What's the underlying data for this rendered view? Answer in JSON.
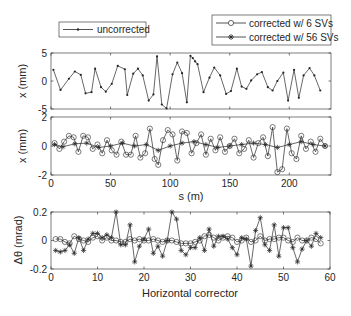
{
  "chart_data": [
    {
      "type": "line",
      "title": "",
      "xlabel": "",
      "ylabel": "x (mm)",
      "xlim": [
        0,
        235
      ],
      "ylim": [
        -5,
        5
      ],
      "yticks": [
        -5,
        0,
        5
      ],
      "xticks": [
        0,
        50,
        100,
        150,
        200
      ],
      "series": [
        {
          "name": "uncorrected",
          "marker": "dot",
          "x": [
            2,
            8,
            15,
            20,
            25,
            29,
            34,
            37,
            42,
            46,
            51,
            56,
            62,
            64,
            69,
            73,
            77,
            82,
            86,
            89,
            93,
            97,
            102,
            106,
            110,
            114,
            117,
            119,
            121,
            123,
            128,
            133,
            137,
            142,
            147,
            151,
            156,
            160,
            164,
            168,
            173,
            177,
            182,
            186,
            190,
            195,
            199,
            204,
            208,
            212,
            217,
            221,
            226
          ],
          "values": [
            2.0,
            -1.6,
            0.4,
            1.7,
            1.1,
            -2.2,
            -2.0,
            2.2,
            -1.1,
            -1.9,
            -0.5,
            2.7,
            2.1,
            -2.5,
            1.3,
            2.2,
            1.0,
            -3.5,
            -2.4,
            4.4,
            -4.2,
            -4.9,
            1.2,
            3.3,
            1.4,
            -3.8,
            4.5,
            4.1,
            3.5,
            3.0,
            -2.0,
            0.6,
            2.4,
            1.0,
            -2.3,
            -1.8,
            2.2,
            -1.0,
            -1.4,
            0.1,
            1.2,
            1.6,
            -1.1,
            -1.7,
            0.0,
            1.5,
            -3.5,
            2.0,
            -3.0,
            1.0,
            2.3,
            1.0,
            -1.7
          ]
        }
      ]
    },
    {
      "type": "line",
      "title": "",
      "xlabel": "s (m)",
      "ylabel": "x (mm)",
      "xlim": [
        0,
        235
      ],
      "ylim": [
        -2,
        2
      ],
      "yticks": [
        -2,
        0,
        2
      ],
      "xticks": [
        0,
        50,
        100,
        150,
        200
      ],
      "series": [
        {
          "name": "corrected w/ 6 SVs",
          "marker": "circle",
          "x": [
            3,
            7,
            11,
            15,
            19,
            23,
            27,
            31,
            35,
            39,
            43,
            47,
            51,
            55,
            59,
            63,
            67,
            71,
            75,
            79,
            83,
            87,
            90,
            94,
            98,
            102,
            106,
            110,
            114,
            118,
            122,
            126,
            130,
            134,
            138,
            142,
            146,
            150,
            154,
            158,
            162,
            166,
            170,
            174,
            178,
            182,
            186,
            190,
            194,
            198,
            202,
            206,
            210,
            214,
            218,
            222,
            226,
            230
          ],
          "values": [
            0.2,
            -0.2,
            0.3,
            0.7,
            0.6,
            -0.4,
            0.7,
            0.6,
            -0.2,
            0.1,
            -0.5,
            0.4,
            -0.3,
            -0.6,
            0.3,
            -0.6,
            -0.6,
            0.7,
            -0.8,
            -0.5,
            1.2,
            -0.9,
            -1.3,
            0.4,
            1.1,
            0.8,
            -1.0,
            1.0,
            0.9,
            -0.5,
            0.2,
            0.8,
            -0.6,
            0.5,
            -0.3,
            0.6,
            -0.4,
            0.0,
            0.5,
            -0.5,
            -0.2,
            0.4,
            -0.8,
            0.2,
            0.6,
            -0.7,
            1.3,
            -1.8,
            -1.6,
            1.2,
            -0.5,
            -0.9,
            0.7,
            -0.2,
            0.3,
            -0.4,
            0.5,
            0.0
          ]
        },
        {
          "name": "corrected w/ 56 SVs",
          "marker": "asterisk",
          "x": [
            3,
            10,
            20,
            30,
            40,
            50,
            60,
            70,
            80,
            90,
            100,
            110,
            120,
            130,
            140,
            150,
            160,
            170,
            180,
            190,
            200,
            210,
            220,
            230
          ],
          "values": [
            0.1,
            -0.05,
            0.15,
            0.2,
            -0.1,
            0.0,
            0.2,
            0.0,
            0.1,
            -0.3,
            0.0,
            0.2,
            0.3,
            0.1,
            -0.1,
            0.0,
            0.1,
            0.2,
            0.1,
            -0.1,
            0.1,
            0.3,
            0.1,
            0.0
          ]
        }
      ]
    },
    {
      "type": "line",
      "title": "",
      "xlabel": "Horizontal corrector",
      "ylabel": "Δθ (mrad)",
      "xlim": [
        0,
        60
      ],
      "ylim": [
        -0.2,
        0.2
      ],
      "yticks": [
        -0.2,
        0,
        0.2
      ],
      "xticks": [
        0,
        10,
        20,
        30,
        40,
        50,
        60
      ],
      "series": [
        {
          "name": "corrected w/ 6 SVs",
          "marker": "circle",
          "x": [
            1,
            2,
            3,
            4,
            5,
            6,
            7,
            8,
            9,
            10,
            11,
            12,
            13,
            14,
            15,
            16,
            17,
            18,
            19,
            20,
            21,
            22,
            23,
            24,
            25,
            26,
            27,
            28,
            29,
            30,
            31,
            32,
            33,
            34,
            35,
            36,
            37,
            38,
            39,
            40,
            41,
            42,
            43,
            44,
            45,
            46,
            47,
            48,
            49,
            50,
            51,
            52,
            53,
            54,
            55,
            56,
            57,
            58
          ],
          "values": [
            0.01,
            0.01,
            -0.01,
            -0.02,
            0.03,
            0.01,
            0.0,
            -0.01,
            0.02,
            0.03,
            0.0,
            0.02,
            0.0,
            0.0,
            -0.01,
            -0.01,
            0.01,
            0.0,
            0.01,
            0.0,
            0.0,
            0.01,
            0.0,
            -0.01,
            0.0,
            0.0,
            -0.01,
            -0.02,
            -0.02,
            -0.02,
            -0.01,
            0.0,
            0.03,
            0.04,
            0.02,
            0.0,
            0.02,
            0.03,
            0.02,
            -0.01,
            0.0,
            0.02,
            -0.01,
            0.0,
            0.03,
            0.0,
            0.01,
            0.01,
            0.02,
            0.02,
            0.0,
            -0.01,
            0.02,
            0.0,
            0.0,
            0.02,
            0.01,
            -0.02
          ]
        },
        {
          "name": "corrected w/ 56 SVs",
          "marker": "asterisk",
          "x": [
            1,
            2,
            3,
            4,
            5,
            6,
            7,
            8,
            9,
            10,
            11,
            12,
            13,
            14,
            15,
            16,
            17,
            18,
            19,
            20,
            21,
            22,
            23,
            24,
            25,
            26,
            27,
            28,
            29,
            30,
            31,
            32,
            33,
            34,
            35,
            36,
            37,
            38,
            39,
            40,
            41,
            42,
            43,
            44,
            45,
            46,
            47,
            48,
            49,
            50,
            51,
            52,
            53,
            54,
            55,
            56,
            57,
            58
          ],
          "values": [
            -0.07,
            -0.08,
            -0.07,
            -0.03,
            -0.09,
            0.02,
            -0.07,
            0.01,
            0.05,
            0.05,
            0.02,
            0.04,
            0.02,
            0.2,
            -0.03,
            -0.03,
            0.11,
            -0.15,
            -0.04,
            0.01,
            0.08,
            -0.09,
            -0.04,
            -0.11,
            0.0,
            0.2,
            0.15,
            -0.07,
            -0.1,
            -0.05,
            -0.05,
            0.02,
            -0.07,
            0.08,
            -0.04,
            0.03,
            0.03,
            0.01,
            -0.05,
            -0.1,
            0.02,
            0.01,
            -0.18,
            0.07,
            0.16,
            -0.03,
            -0.07,
            0.11,
            -0.11,
            0.09,
            0.09,
            -0.05,
            -0.15,
            -0.06,
            0.0,
            -0.04,
            0.05,
            0.02
          ]
        }
      ]
    }
  ],
  "legend_top_left": {
    "label": "uncorrected"
  },
  "legend_top_right": {
    "label_6": "corrected w/ 6 SVs",
    "label_56": "corrected w/ 56 SVs"
  },
  "axes": {
    "top_ylabel": "x (mm)",
    "mid_ylabel": "x (mm)",
    "mid_xlabel": "s (m)",
    "bot_ylabel": "Δθ (mrad)",
    "bot_xlabel": "Horizontal corrector",
    "s_ticks": [
      "0",
      "50",
      "100",
      "150",
      "200"
    ],
    "top_yticks": [
      "5",
      "0",
      "-5"
    ],
    "mid_yticks": [
      "2",
      "0",
      "-2"
    ],
    "bot_yticks": [
      "0.2",
      "0",
      "-0.2"
    ],
    "corr_ticks": [
      "0",
      "10",
      "20",
      "30",
      "40",
      "50",
      "60"
    ]
  }
}
